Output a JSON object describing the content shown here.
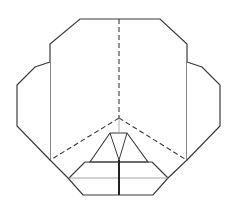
{
  "diagram": {
    "type": "origami-fold-step",
    "stroke_color": "#3a3a3a",
    "light_stroke_color": "#9a9a9a",
    "background": "#ffffff",
    "outline": {
      "main_body": [
        [
          80,
          19
        ],
        [
          160,
          19
        ],
        [
          187,
          44
        ],
        [
          187,
          160
        ],
        [
          168,
          178
        ],
        [
          153,
          195
        ],
        [
          83,
          195
        ],
        [
          68,
          178
        ],
        [
          50,
          160
        ],
        [
          50,
          44
        ]
      ],
      "left_flap": [
        [
          50,
          62
        ],
        [
          35,
          67
        ],
        [
          17,
          85
        ],
        [
          17,
          126
        ],
        [
          50,
          160
        ]
      ],
      "right_flap": [
        [
          187,
          62
        ],
        [
          202,
          67
        ],
        [
          220,
          85
        ],
        [
          220,
          126
        ],
        [
          187,
          160
        ]
      ]
    },
    "valley_folds_dashed": [
      [
        [
          119,
          19
        ],
        [
          119,
          118
        ]
      ],
      [
        [
          119,
          118
        ],
        [
          52,
          159
        ]
      ],
      [
        [
          119,
          118
        ],
        [
          185,
          159
        ]
      ]
    ],
    "inner_lines": {
      "trapezoid": [
        [
          110,
          133
        ],
        [
          127,
          133
        ],
        [
          148,
          162
        ],
        [
          90,
          162
        ]
      ],
      "inner_triangle": [
        [
          110,
          133
        ],
        [
          119,
          160
        ],
        [
          127,
          133
        ]
      ],
      "band_top": [
        [
          85,
          162
        ],
        [
          152,
          162
        ]
      ],
      "band_side_left": [
        [
          85,
          162
        ],
        [
          69,
          178
        ]
      ],
      "band_side_right": [
        [
          152,
          162
        ],
        [
          168,
          178
        ]
      ],
      "band_mid_light": [
        [
          69,
          178
        ],
        [
          168,
          178
        ]
      ],
      "center_heavy": [
        [
          119,
          160
        ],
        [
          119,
          195
        ]
      ],
      "center_light_top": [
        [
          119,
          118
        ],
        [
          119,
          133
        ]
      ]
    }
  }
}
